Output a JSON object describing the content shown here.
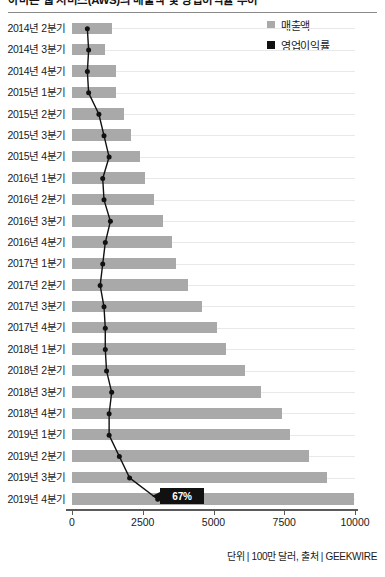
{
  "title": "아마존 웹 서비스(AWS)의 매출액 및 영업이익률 추이",
  "legend": {
    "items": [
      {
        "label": "매출액",
        "color": "#a9a9a9",
        "name": "revenue"
      },
      {
        "label": "영업이익률",
        "color": "#111111",
        "name": "operating-margin"
      }
    ]
  },
  "footer": "단위 | 100만 달러, 출처 | GEEKWIRE",
  "axis": {
    "ticks": [
      "0",
      "2500",
      "5000",
      "7500",
      "10000"
    ],
    "tick_values": [
      0,
      2500,
      5000,
      7500,
      10000
    ]
  },
  "annotation": {
    "label": "67%",
    "attached_to": "2019년 4분기"
  },
  "chart_data": {
    "type": "bar",
    "title": "아마존 웹 서비스(AWS)의 매출액 및 영업이익률 추이",
    "orientation": "horizontal",
    "xlabel": "",
    "ylabel": "",
    "xlim": [
      0,
      10000
    ],
    "grid": true,
    "legend_position": "top-right",
    "categories": [
      "2014년 2분기",
      "2014년 3분기",
      "2014년 4분기",
      "2015년 1분기",
      "2015년 2분기",
      "2015년 3분기",
      "2015년 4분기",
      "2016년 1분기",
      "2016년 2분기",
      "2016년 3분기",
      "2016년 4분기",
      "2017년 1분기",
      "2017년 2분기",
      "2017년 3분기",
      "2017년 4분기",
      "2018년 1분기",
      "2018년 2분기",
      "2018년 3분기",
      "2018년 4분기",
      "2019년 1분기",
      "2019년 2분기",
      "2019년 3분기",
      "2019년 4분기"
    ],
    "series": [
      {
        "name": "매출액",
        "type": "bar",
        "color": "#a9a9a9",
        "unit": "100만 달러",
        "values": [
          1420,
          1170,
          1570,
          1570,
          1820,
          2090,
          2410,
          2570,
          2890,
          3230,
          3530,
          3660,
          4100,
          4580,
          5110,
          5440,
          6110,
          6680,
          7430,
          7700,
          8380,
          9000,
          9950
        ]
      },
      {
        "name": "영업이익률",
        "type": "line",
        "color": "#111111",
        "unit": "%",
        "axis": "secondary",
        "values": [
          12,
          13,
          12,
          13,
          21,
          25,
          29,
          24,
          25,
          30,
          26,
          24,
          22,
          25,
          26,
          26,
          27,
          31,
          29,
          29,
          37,
          45,
          67
        ]
      }
    ]
  }
}
